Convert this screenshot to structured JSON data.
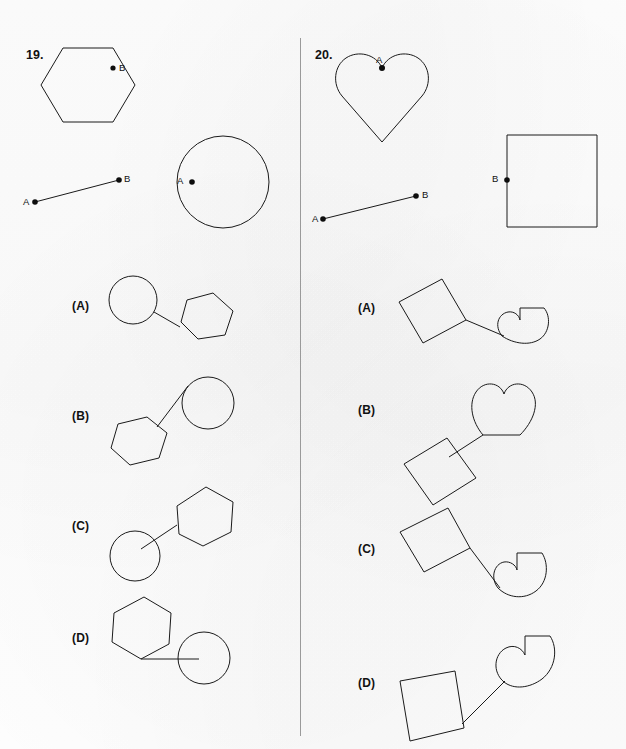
{
  "page": {
    "width": 626,
    "height": 749,
    "background_color": "#fdfdfd",
    "ink_color": "#1a1a1a",
    "divider_color": "#9a9a9a"
  },
  "divider": {
    "x": 300,
    "y_top": 38,
    "y_bottom": 736
  },
  "questions": [
    {
      "number": "19.",
      "number_pos": {
        "x": 26,
        "y": 48
      },
      "prompt": {
        "shape_top": {
          "name": "hexagon",
          "point_label": "B",
          "point_label_pos": {
            "x": 119,
            "y": 62
          },
          "point_pos": {
            "x": 113,
            "y": 68
          }
        },
        "segment": {
          "a_label": "A",
          "b_label": "B",
          "a_pos": {
            "x": 35,
            "y": 202
          },
          "b_pos": {
            "x": 119,
            "y": 180
          },
          "a_label_pos": {
            "x": 23,
            "y": 196
          },
          "b_label_pos": {
            "x": 124,
            "y": 173
          }
        },
        "shape_right": {
          "name": "circle",
          "point_label": "A",
          "point_label_pos": {
            "x": 177,
            "y": 175
          },
          "point_pos": {
            "x": 192,
            "y": 182
          }
        }
      },
      "options": [
        {
          "label": "(A)",
          "label_pos": {
            "x": 72,
            "y": 299
          },
          "shapes": "circle-left-hexagon-right"
        },
        {
          "label": "(B)",
          "label_pos": {
            "x": 72,
            "y": 409
          },
          "shapes": "hexagon-lower-left-circle-upper-right"
        },
        {
          "label": "(C)",
          "label_pos": {
            "x": 72,
            "y": 519
          },
          "shapes": "circle-lower-left-hexagon-upper-right"
        },
        {
          "label": "(D)",
          "label_pos": {
            "x": 72,
            "y": 631
          },
          "shapes": "hexagon-upper-left-circle-lower-right"
        }
      ]
    },
    {
      "number": "20.",
      "number_pos": {
        "x": 315,
        "y": 48
      },
      "prompt": {
        "shape_top": {
          "name": "heart",
          "point_label": "A",
          "point_label_pos": {
            "x": 376,
            "y": 54
          },
          "point_pos": {
            "x": 381,
            "y": 68
          }
        },
        "segment": {
          "a_label": "A",
          "b_label": "B",
          "a_pos": {
            "x": 323,
            "y": 219
          },
          "b_pos": {
            "x": 416,
            "y": 196
          },
          "a_label_pos": {
            "x": 312,
            "y": 213
          },
          "b_label_pos": {
            "x": 422,
            "y": 189
          }
        },
        "shape_right": {
          "name": "square",
          "point_label": "B",
          "point_label_pos": {
            "x": 492,
            "y": 173
          },
          "point_pos": {
            "x": 507,
            "y": 180
          }
        }
      },
      "options": [
        {
          "label": "(A)",
          "label_pos": {
            "x": 358,
            "y": 301
          },
          "shapes": "square-left-heart-right"
        },
        {
          "label": "(B)",
          "label_pos": {
            "x": 358,
            "y": 403
          },
          "shapes": "square-lower-left-heart-upper-right"
        },
        {
          "label": "(C)",
          "label_pos": {
            "x": 358,
            "y": 542
          },
          "shapes": "square-upper-left-heart-lower-right"
        },
        {
          "label": "(D)",
          "label_pos": {
            "x": 358,
            "y": 676
          },
          "shapes": "square-lower-left-heart-upper-right-2"
        }
      ]
    }
  ]
}
